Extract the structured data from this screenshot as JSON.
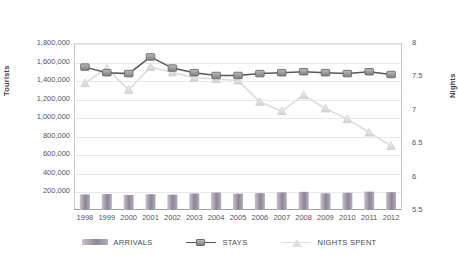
{
  "chart_data": {
    "type": "line",
    "title": "",
    "subtitle": "",
    "xlabel": "",
    "ylabel": "Tourists",
    "y2label": "Nights",
    "categories": [
      "1998",
      "1999",
      "2000",
      "2001",
      "2002",
      "2003",
      "2004",
      "2005",
      "2006",
      "2007",
      "2008",
      "2009",
      "2010",
      "2011",
      "2012"
    ],
    "ylim": [
      0,
      1800000
    ],
    "y2lim": [
      5.5,
      8
    ],
    "yticks": [
      "200,000",
      "400,000",
      "600,000",
      "800,000",
      "1,000,000",
      "1,200,000",
      "1,400,000",
      "1,600,000",
      "1,800,000"
    ],
    "ytick_values": [
      200000,
      400000,
      600000,
      800000,
      1000000,
      1200000,
      1400000,
      1600000,
      1800000
    ],
    "y2ticks": [
      "5.5",
      "6",
      "6.5",
      "7",
      "7.5",
      "8"
    ],
    "y2tick_values": [
      5.5,
      6,
      6.5,
      7,
      7.5,
      8
    ],
    "grid": true,
    "legend_position": "bottom",
    "series": [
      {
        "name": "ARRIVALS",
        "label": "ARRIVALS",
        "type": "bar",
        "axis": "left",
        "color": "#9c93a3",
        "values": [
          168000,
          172000,
          162000,
          170000,
          166000,
          178000,
          188000,
          176000,
          182000,
          190000,
          196000,
          180000,
          186000,
          198000,
          192000
        ]
      },
      {
        "name": "STAYS",
        "label": "STAYS",
        "type": "line",
        "marker": "square",
        "axis": "left",
        "color": "#6f6f6f",
        "values": [
          1540000,
          1480000,
          1470000,
          1650000,
          1530000,
          1480000,
          1450000,
          1450000,
          1470000,
          1480000,
          1490000,
          1480000,
          1470000,
          1490000,
          1460000
        ]
      },
      {
        "name": "NIGHTS SPENT",
        "label": "NIGHTS SPENT",
        "type": "line",
        "marker": "triangle",
        "axis": "right",
        "color": "#d4d4d4",
        "values": [
          7.4,
          7.62,
          7.3,
          7.64,
          7.56,
          7.48,
          7.46,
          7.44,
          7.12,
          6.98,
          7.22,
          7.02,
          6.86,
          6.66,
          6.46
        ]
      }
    ]
  },
  "legend": {
    "items": [
      {
        "label": "ARRIVALS",
        "marker": "bar",
        "color": "#9c93a3"
      },
      {
        "label": "STAYS",
        "marker": "square-line",
        "color": "#6f6f6f"
      },
      {
        "label": "NIGHTS SPENT",
        "marker": "triangle-line",
        "color": "#d7d7d7"
      }
    ]
  },
  "colors": {
    "arrivals": "#9c93a3",
    "stays": "#6f6f6f",
    "nights_spent": "#d4d4d4",
    "grid": "#e9e9e9",
    "axis": "#c8c8c8",
    "text": "#555555"
  }
}
